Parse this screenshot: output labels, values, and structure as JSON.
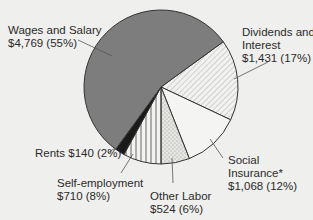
{
  "chart_data": {
    "type": "pie",
    "title": "",
    "start_angle_deg": -36,
    "direction": "clockwise",
    "slices": [
      {
        "name": "Dividends and Interest",
        "value": 1431,
        "percent": 17,
        "fill": "hatch-diagonal"
      },
      {
        "name": "Social Insurance*",
        "value": 1068,
        "percent": 12,
        "fill": "#f4f4f2"
      },
      {
        "name": "Other Labor",
        "value": 524,
        "percent": 6,
        "fill": "stipple"
      },
      {
        "name": "Self-employment",
        "value": 710,
        "percent": 8,
        "fill": "hatch-vertical"
      },
      {
        "name": "Rents",
        "value": 140,
        "percent": 2,
        "fill": "#1a1a1a"
      },
      {
        "name": "Wages and Salary",
        "value": 4769,
        "percent": 55,
        "fill": "#7d7d7d"
      }
    ],
    "units": "$",
    "legend": "none (direct labels)"
  },
  "labels": {
    "wages": {
      "line1": "Wages and Salary",
      "line2": "$4,769  (55%)"
    },
    "dividends": {
      "line1": "Dividends and",
      "line2": "Interest",
      "line3": "$1,431  (17%)"
    },
    "social": {
      "line1": "Social",
      "line2": "Insurance*",
      "line3": "$1,068  (12%)"
    },
    "other_labor": {
      "line1": "Other Labor",
      "line2": "$524  (6%)"
    },
    "self_employment": {
      "line1": "Self-employment",
      "line2": "$710  (8%)"
    },
    "rents": {
      "line1": "Rents $140 (2%)"
    }
  },
  "colors": {
    "background": "#efefed",
    "wages": "#7d7d7d",
    "rents": "#1a1a1a",
    "outline": "#333333"
  }
}
